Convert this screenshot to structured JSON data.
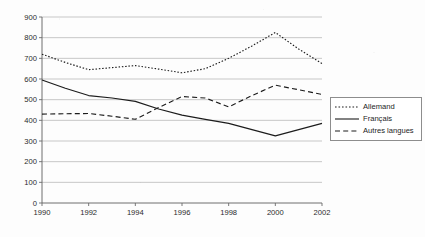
{
  "chart_data": {
    "type": "line",
    "title": "",
    "subtitle": "",
    "xlabel": "",
    "ylabel": "",
    "xlim": [
      1990,
      2002
    ],
    "ylim": [
      0,
      900
    ],
    "grid": true,
    "legend_position": "right",
    "x": [
      1990,
      1991,
      1992,
      1993,
      1994,
      1995,
      1996,
      1997,
      1998,
      1999,
      2000,
      2001,
      2002
    ],
    "x_tick_labels": [
      "1990",
      "1992",
      "1994",
      "1996",
      "1998",
      "2000",
      "2002"
    ],
    "x_ticks": [
      1990,
      1992,
      1994,
      1996,
      1998,
      2000,
      2002
    ],
    "y_ticks": [
      0,
      100,
      200,
      300,
      400,
      500,
      600,
      700,
      800,
      900
    ],
    "y_tick_labels": [
      "0",
      "100",
      "200",
      "300",
      "400",
      "500",
      "600",
      "700",
      "800",
      "900"
    ],
    "series": [
      {
        "name": "Allemand",
        "style": "dotted",
        "color": "#1c1c1c",
        "values": [
          720,
          680,
          645,
          655,
          665,
          648,
          630,
          650,
          700,
          760,
          825,
          745,
          675
        ]
      },
      {
        "name": "Français",
        "style": "solid",
        "color": "#1c1c1c",
        "values": [
          595,
          555,
          520,
          508,
          492,
          455,
          425,
          405,
          385,
          355,
          325,
          355,
          385
        ]
      },
      {
        "name": "Autres langues",
        "style": "dashed",
        "color": "#1c1c1c",
        "values": [
          430,
          432,
          433,
          420,
          405,
          462,
          515,
          508,
          465,
          520,
          570,
          548,
          525
        ]
      }
    ]
  },
  "legend": {
    "items": [
      {
        "label": "Allemand",
        "style": "dotted"
      },
      {
        "label": "Français",
        "style": "solid"
      },
      {
        "label": "Autres langues",
        "style": "dashed"
      }
    ]
  }
}
